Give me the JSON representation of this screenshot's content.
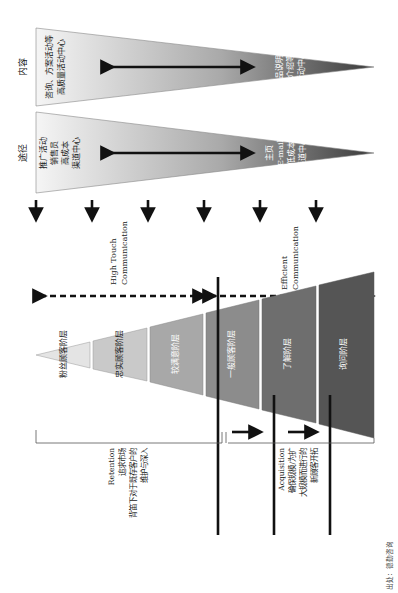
{
  "diagram": {
    "orientation": "rotated-90-clockwise",
    "top_panels": {
      "content": {
        "label": "内容",
        "wide_end_text": [
          "咨询、方案活动等",
          "高质量活动中心"
        ],
        "narrow_end_text": [
          "商品说明、",
          "销售介绍等 PR",
          "活动中心"
        ]
      },
      "channel": {
        "label": "途径",
        "wide_end_text": [
          "推广活动",
          "销售员",
          "高成本",
          "渠道中心"
        ],
        "narrow_end_text": [
          "主页",
          "E-mail",
          "低成本",
          "渠道中心"
        ]
      }
    },
    "down_arrows_count": 6,
    "communication": {
      "high_touch": [
        "High Touch",
        "Communication"
      ],
      "efficient": [
        "Efficient",
        "Communication"
      ]
    },
    "funnel_layers": [
      {
        "label": "粉丝顾客阶层",
        "fill": "#e4e4e4"
      },
      {
        "label": "忠实顾客阶层",
        "fill": "#c9c9c9"
      },
      {
        "label": "较满意阶层",
        "fill": "#a8a8a8"
      },
      {
        "label": "一般顾客阶层",
        "fill": "#8c8c8c"
      },
      {
        "label": "了解阶层",
        "fill": "#6e6e6e"
      },
      {
        "label": "询问阶层",
        "fill": "#555555"
      }
    ],
    "retention": {
      "title": "Retention",
      "lines": [
        "追求市场",
        "背笛下对于既存客户的",
        "维护与深入"
      ]
    },
    "acquisition": {
      "title": "Acquisition",
      "lines": [
        "确保规模/为扩",
        "大规模而进行的",
        "新顾客开拓"
      ]
    },
    "source": "出处：德勤咨询",
    "colors": {
      "gradient_light": "#f4f4f4",
      "gradient_dark": "#3c3c3c",
      "arrow": "#111111",
      "line": "#555555"
    }
  }
}
